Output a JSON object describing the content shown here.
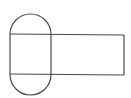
{
  "diagram": {
    "width": 131,
    "height": 98,
    "background": "#ffffff",
    "stroke_color": "#4a4a4a",
    "stroke_width": 1.2,
    "shapes": [
      {
        "type": "stadium",
        "name": "vertical-stadium",
        "x": 10,
        "y": 14,
        "width": 41,
        "height": 81
      },
      {
        "type": "line",
        "name": "top-chord",
        "x1": 10,
        "y1": 34,
        "x2": 124,
        "y2": 35
      },
      {
        "type": "line",
        "name": "bottom-chord",
        "x1": 10,
        "y1": 74,
        "x2": 124,
        "y2": 75
      },
      {
        "type": "line",
        "name": "rect-right-edge",
        "x1": 124,
        "y1": 35,
        "x2": 124,
        "y2": 75
      }
    ]
  }
}
